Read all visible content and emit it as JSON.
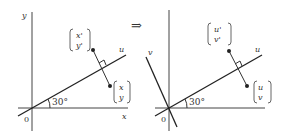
{
  "implies_symbol": "⇒",
  "left_panel": {
    "axis_x_label": "x",
    "axis_y_label": "y",
    "line_label": "u",
    "origin_label": "0",
    "angle_label": "30°",
    "point_original": {
      "top": "x",
      "bottom": "y"
    },
    "point_reflected": {
      "top": "x'",
      "bottom": "y'"
    }
  },
  "right_panel": {
    "axis_u_label": "u",
    "axis_v_label": "v",
    "origin_label": "0",
    "angle_label": "30°",
    "point_original": {
      "top": "u",
      "bottom": "v"
    },
    "point_reflected": {
      "top": "u'",
      "bottom": "v'"
    }
  },
  "colors": {
    "ink": "#333333",
    "background": "#ffffff"
  }
}
